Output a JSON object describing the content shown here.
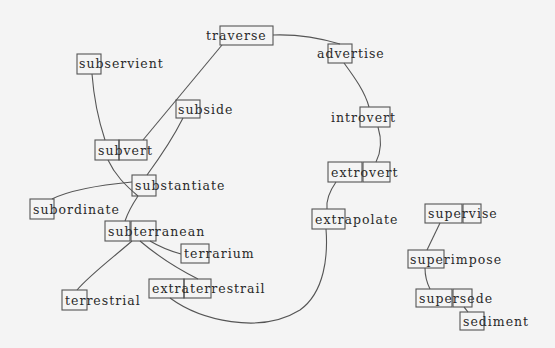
{
  "diagram": {
    "background": "#f4f4f4",
    "line_color": "#555555",
    "text_color": "#2a2a2a",
    "nodes": [
      {
        "id": "traverse",
        "label": "traverse",
        "x": 206,
        "y": 40,
        "boxes": [
          [
            220,
            26,
            53,
            19
          ]
        ]
      },
      {
        "id": "subservient",
        "label": "subservient",
        "x": 79,
        "y": 68,
        "boxes": [
          [
            77,
            54,
            24,
            20
          ]
        ]
      },
      {
        "id": "advertise",
        "label": "advertise",
        "x": 317,
        "y": 58,
        "boxes": [
          [
            328,
            44,
            24,
            19
          ]
        ]
      },
      {
        "id": "subvert",
        "label": "subvert",
        "x": 98,
        "y": 155,
        "boxes": [
          [
            95,
            140,
            24,
            20
          ],
          [
            119,
            140,
            28,
            20
          ]
        ]
      },
      {
        "id": "subside",
        "label": "subside",
        "x": 178,
        "y": 114,
        "boxes": [
          [
            176,
            100,
            24,
            18
          ]
        ]
      },
      {
        "id": "introvert",
        "label": "introvert",
        "x": 331,
        "y": 122,
        "boxes": [
          [
            360,
            107,
            30,
            20
          ]
        ]
      },
      {
        "id": "substantiate",
        "label": "substantiate",
        "x": 135,
        "y": 190,
        "boxes": [
          [
            132,
            175,
            24,
            21
          ]
        ]
      },
      {
        "id": "extrovert",
        "label": "extrovert",
        "x": 331,
        "y": 177,
        "boxes": [
          [
            328,
            162,
            34,
            20
          ],
          [
            363,
            162,
            27,
            20
          ]
        ]
      },
      {
        "id": "subordinate",
        "label": "subordinate",
        "x": 33,
        "y": 214,
        "boxes": [
          [
            30,
            199,
            24,
            20
          ]
        ]
      },
      {
        "id": "supervise",
        "label": "supervise",
        "x": 428,
        "y": 218,
        "boxes": [
          [
            425,
            204,
            37,
            19
          ],
          [
            463,
            204,
            18,
            19
          ]
        ]
      },
      {
        "id": "extrapolate",
        "label": "extrapolate",
        "x": 315,
        "y": 224,
        "boxes": [
          [
            312,
            209,
            33,
            20
          ]
        ]
      },
      {
        "id": "subterranean",
        "label": "subterranean",
        "x": 108,
        "y": 236,
        "boxes": [
          [
            105,
            221,
            25,
            20
          ],
          [
            131,
            221,
            25,
            20
          ]
        ]
      },
      {
        "id": "terrarium",
        "label": "terrarium",
        "x": 184,
        "y": 258,
        "boxes": [
          [
            181,
            244,
            28,
            19
          ]
        ]
      },
      {
        "id": "superimpose",
        "label": "superimpose",
        "x": 410,
        "y": 264,
        "boxes": [
          [
            408,
            250,
            36,
            18
          ]
        ]
      },
      {
        "id": "extraterrestrail",
        "label": "extraterrestrail",
        "x": 152,
        "y": 293,
        "boxes": [
          [
            149,
            279,
            35,
            19
          ],
          [
            184,
            279,
            27,
            19
          ]
        ]
      },
      {
        "id": "terrestrial",
        "label": "terrestrial",
        "x": 65,
        "y": 305,
        "boxes": [
          [
            62,
            290,
            25,
            20
          ]
        ]
      },
      {
        "id": "supersede",
        "label": "supersede",
        "x": 419,
        "y": 303,
        "boxes": [
          [
            416,
            289,
            36,
            18
          ],
          [
            453,
            289,
            19,
            18
          ]
        ]
      },
      {
        "id": "sediment",
        "label": "sediment",
        "x": 463,
        "y": 326,
        "boxes": [
          [
            460,
            312,
            24,
            18
          ]
        ]
      }
    ],
    "edges": [
      {
        "from": "traverse",
        "to": "advertise",
        "d": "M273,35 C300,34 320,38 340,44"
      },
      {
        "from": "traverse",
        "to": "subvert",
        "d": "M222,45 L143,140"
      },
      {
        "from": "subservient",
        "to": "subvert",
        "d": "M92,74 C94,100 100,125 105,140"
      },
      {
        "from": "subvert",
        "to": "substantiate",
        "d": "M108,160 C115,175 125,185 138,196"
      },
      {
        "from": "subside",
        "to": "substantiate",
        "d": "M183,118 C172,140 158,160 147,175"
      },
      {
        "from": "advertise",
        "to": "introvert",
        "d": "M344,63 C355,78 365,92 369,107"
      },
      {
        "from": "introvert",
        "to": "extrovert",
        "d": "M378,127 C382,140 381,152 376,162"
      },
      {
        "from": "extrovert",
        "to": "extrapolate",
        "d": "M336,182 C329,192 326,200 327,209"
      },
      {
        "from": "substantiate",
        "to": "subordinate",
        "d": "M132,182 C100,185 70,190 52,199"
      },
      {
        "from": "substantiate",
        "to": "subterranean",
        "d": "M138,196 C132,205 128,212 125,221"
      },
      {
        "from": "subterranean",
        "to": "terrarium",
        "d": "M150,241 C160,247 170,251 181,254"
      },
      {
        "from": "subterranean",
        "to": "extraterrestrail",
        "d": "M140,241 C160,258 180,270 198,279"
      },
      {
        "from": "subterranean",
        "to": "terrestrial",
        "d": "M132,241 C110,260 90,275 77,290"
      },
      {
        "from": "extraterrestrail",
        "to": "extrapolate",
        "d": "M170,298 C200,320 260,335 300,310 C325,292 328,255 326,229"
      },
      {
        "from": "supervise",
        "to": "superimpose",
        "d": "M440,223 L427,250"
      },
      {
        "from": "superimpose",
        "to": "supersede",
        "d": "M425,268 C425,276 427,283 430,289"
      },
      {
        "from": "supersede",
        "to": "sediment",
        "d": "M464,307 C466,309 467,311 468,312"
      }
    ]
  }
}
